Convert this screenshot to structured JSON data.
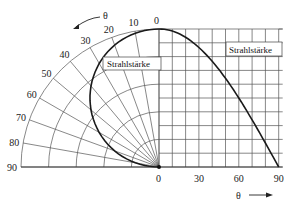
{
  "diagram": {
    "polar": {
      "label_box": "Strahlstärke",
      "angle_symbol": "θ",
      "angle_ticks": [
        "0",
        "10",
        "20",
        "30",
        "40",
        "50",
        "60",
        "70",
        "80",
        "90"
      ],
      "ring_count": 5,
      "spoke_step_deg": 10
    },
    "cartesian": {
      "label_box": "Strahlstärke",
      "x_axis_symbol": "θ",
      "x_ticks": [
        "0",
        "30",
        "60",
        "90"
      ],
      "columns": 9,
      "rows": 10
    },
    "curve": "Lambertian-like intensity distribution I(θ) = cos θ",
    "colors": {
      "line": "#222222",
      "grid": "#444444",
      "background": "#ffffff"
    }
  },
  "chart_data": {
    "type": "line",
    "title": "Strahlstärke",
    "xlabel": "θ",
    "ylabel": "Strahlstärke",
    "x": [
      0,
      10,
      20,
      30,
      40,
      50,
      60,
      70,
      80,
      90
    ],
    "values": [
      1.0,
      0.985,
      0.94,
      0.866,
      0.766,
      0.643,
      0.5,
      0.342,
      0.174,
      0.0
    ],
    "xlim": [
      0,
      90
    ],
    "ylim": [
      0,
      1
    ]
  }
}
